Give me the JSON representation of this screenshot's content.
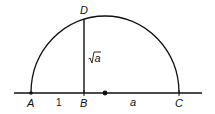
{
  "diagram": {
    "type": "geometric-construction",
    "points": {
      "A": {
        "label": "A",
        "x": 31,
        "y": 93
      },
      "B": {
        "label": "B",
        "x": 84,
        "y": 93
      },
      "C": {
        "label": "C",
        "x": 179,
        "y": 93
      },
      "D": {
        "label": "D",
        "x": 84,
        "y": 19
      },
      "center": {
        "x": 105,
        "y": 93
      }
    },
    "segments": {
      "AB": {
        "label": "1"
      },
      "BC": {
        "label": "a"
      },
      "BD": {
        "label_radical": "√",
        "label_var": "a"
      }
    },
    "colors": {
      "stroke": "#111111",
      "background": "#ffffff"
    }
  }
}
